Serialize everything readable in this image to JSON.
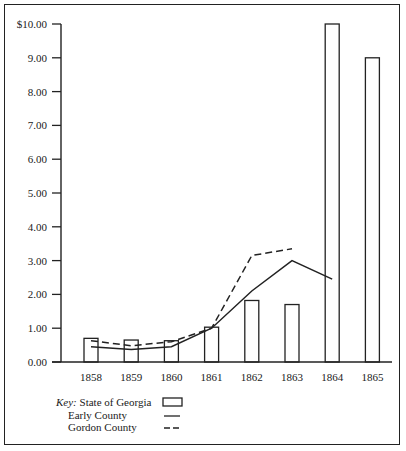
{
  "chart_data": {
    "type": "bar",
    "title": "",
    "xlabel": "",
    "ylabel": "",
    "ylim": [
      0,
      10
    ],
    "grid": false,
    "categories": [
      "1858",
      "1859",
      "1860",
      "1861",
      "1862",
      "1863",
      "1864",
      "1865"
    ],
    "y_ticks": [
      "0.00",
      "1.00",
      "2.00",
      "3.00",
      "4.00",
      "5.00",
      "6.00",
      "7.00",
      "8.00",
      "9.00",
      "$10.00"
    ],
    "series": [
      {
        "name": "State of Georgia",
        "style": "bar-outline",
        "values": [
          0.7,
          0.65,
          0.63,
          1.03,
          1.82,
          1.7,
          10.0,
          9.0
        ]
      },
      {
        "name": "Early County",
        "style": "solid-line",
        "values": [
          0.45,
          0.37,
          0.45,
          1.0,
          2.1,
          3.0,
          2.45,
          null
        ]
      },
      {
        "name": "Gordon County",
        "style": "dashed-line",
        "values": [
          0.63,
          0.48,
          0.6,
          1.0,
          3.15,
          3.35,
          null,
          null
        ]
      }
    ],
    "legend": {
      "position": "bottom-left",
      "key_label": "Key:"
    }
  },
  "legend": {
    "key_label": "Key:",
    "items": [
      "State of Georgia",
      "Early County",
      "Gordon County"
    ]
  }
}
